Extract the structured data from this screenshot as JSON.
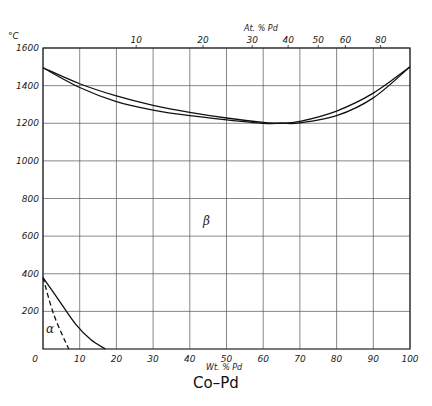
{
  "chart_data": {
    "type": "line",
    "title": "Co–Pd",
    "xlabel": "Wt. % Pd",
    "x2label": "At. % Pd",
    "ylabel": "°C",
    "xlim": [
      0,
      100
    ],
    "ylim": [
      0,
      1600
    ],
    "grid": true,
    "x_ticks": [
      "0",
      "10",
      "20",
      "30",
      "40",
      "50",
      "60",
      "70",
      "80",
      "90",
      "100"
    ],
    "y_ticks": [
      "200",
      "400",
      "600",
      "800",
      "1000",
      "1200",
      "1400",
      "1600"
    ],
    "x2_ticks": [
      {
        "label": "10",
        "wt": 25.4
      },
      {
        "label": "20",
        "wt": 43.6
      },
      {
        "label": "30",
        "wt": 57.0
      },
      {
        "label": "40",
        "wt": 66.8
      },
      {
        "label": "50",
        "wt": 75.0
      },
      {
        "label": "60",
        "wt": 82.4
      },
      {
        "label": "80",
        "wt": 92.0
      }
    ],
    "series": [
      {
        "name": "Liquidus",
        "style": "solid",
        "x": [
          0,
          10,
          20,
          30,
          40,
          50,
          60,
          65,
          70,
          80,
          90,
          100
        ],
        "y": [
          1495,
          1410,
          1345,
          1295,
          1258,
          1228,
          1205,
          1200,
          1210,
          1265,
          1360,
          1500
        ]
      },
      {
        "name": "Solidus",
        "style": "solid",
        "x": [
          0,
          10,
          20,
          30,
          40,
          50,
          60,
          65,
          70,
          80,
          90,
          100
        ],
        "y": [
          1495,
          1390,
          1315,
          1270,
          1240,
          1218,
          1200,
          1200,
          1202,
          1240,
          1335,
          1500
        ]
      },
      {
        "name": "Magnetic/allotropic boundary",
        "style": "solid",
        "x": [
          0,
          5,
          9,
          13,
          17
        ],
        "y": [
          380,
          240,
          130,
          50,
          0
        ]
      },
      {
        "name": "α phase boundary",
        "style": "dashed",
        "x": [
          0,
          3,
          7
        ],
        "y": [
          380,
          180,
          0
        ]
      }
    ],
    "annotations": [
      {
        "text": "β",
        "x": 48,
        "y": 620
      },
      {
        "text": "α",
        "x": 4,
        "y": 110
      }
    ]
  },
  "labels": {
    "y_unit": "°C",
    "top_axis_title": "At. % Pd",
    "bottom_axis_title": "Wt. % Pd",
    "caption": "Co–Pd",
    "phase_beta": "β",
    "phase_alpha": "α"
  }
}
